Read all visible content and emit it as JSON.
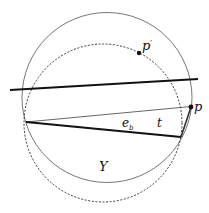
{
  "labels": {
    "p_prime": "p",
    "p_prime_mark": "′",
    "p": "p",
    "e_b": "e",
    "e_b_sub": "b",
    "t": "t",
    "Y": "Y"
  },
  "colors": {
    "stroke": "#111111",
    "thin_stroke": "#555555"
  }
}
